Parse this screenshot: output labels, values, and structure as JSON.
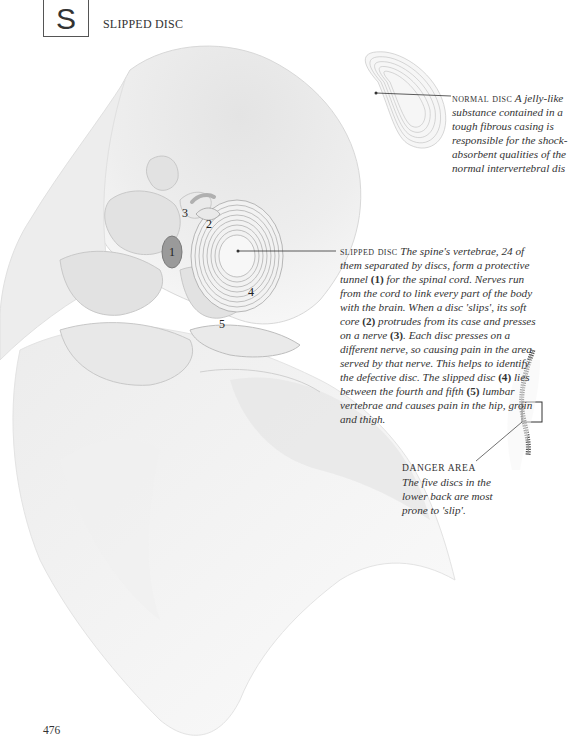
{
  "header": {
    "section_letter": "S",
    "section_title": "SLIPPED DISC"
  },
  "captions": {
    "normal_disc": {
      "heading": "NORMAL DISC",
      "lines": [
        "A jelly-like",
        "substance contained in a",
        "tough fibrous casing is",
        "responsible for the shock-",
        "absorbent qualities of the",
        "normal intervertebral dis"
      ]
    },
    "slipped_disc": {
      "heading": "SLIPPED DISC",
      "segments": [
        "The spine's vertebrae, 24 of them separated by discs, form a protective tunnel ",
        "(1)",
        " for the spinal cord. Nerves run from the cord to link every part of the body with the brain. When a disc 'slips', its soft core ",
        "(2)",
        " protrudes from its case and presses on a nerve ",
        "(3)",
        ". Each disc presses on a different nerve, so causing pain in the area served by that nerve. This helps to identify the defective disc. The slipped disc ",
        "(4)",
        " lies between the fourth and fifth ",
        "(5)",
        " lumbar vertebrae and causes pain in the hip, groin and thigh."
      ]
    },
    "danger_area": {
      "heading": "DANGER AREA",
      "text": "The five discs in the lower back are most prone to 'slip'."
    }
  },
  "illustration_labels": {
    "n1": "1",
    "n2": "2",
    "n3": "3",
    "n4": "4",
    "n5": "5"
  },
  "colors": {
    "bone_fill": "#e9e9e9",
    "bone_shadow": "#cfcfcf",
    "line": "#333333",
    "text": "#333333"
  },
  "footer": {
    "page_number": "476"
  }
}
